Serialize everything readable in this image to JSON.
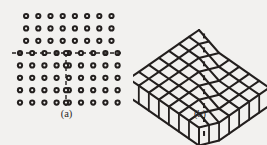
{
  "figure": {
    "background_color": "#f2f1ef",
    "ink_color": "#231f1e",
    "panels": [
      {
        "id": "a",
        "caption": "(a)",
        "type": "2d-atomic-lattice-edge-dislocation",
        "description": "Two-dimensional array of atoms (small open circles) containing an edge dislocation; horizontal dashed slip plane and vertical dashed extra half-plane trace.",
        "upper_rows": 3,
        "upper_columns": 8,
        "slip_row_columns": 9,
        "lower_rows": 4,
        "lower_columns": 9,
        "atom_symbol": "open-circle",
        "atom_outer_radius_px": 3.1,
        "atom_inner_radius_px": 1.1,
        "column_spacing_px": 12.2,
        "row_spacing_px": 12.4,
        "grid_left_px": 20,
        "grid_top_px": 16,
        "slip_plane_y_px": 53,
        "slip_plane_x_start_px": 12,
        "slip_plane_x_end_px": 122,
        "half_plane_x_px": 66,
        "half_plane_y_start_px": 53,
        "half_plane_y_end_px": 107,
        "dash_pattern": "4 3"
      },
      {
        "id": "b",
        "caption": "(b)",
        "type": "3d-isometric-lattice-block",
        "description": "Three-dimensional isometric ball-and-stick lattice block whose top surface is stepped by a dislocation line; vertical legs descend from the front and right edges.",
        "top_grid_rows": 7,
        "top_grid_cols": 7,
        "step_offset_px": 9,
        "leg_count_front": 8,
        "leg_count_right": 6,
        "leg_length_px": 18,
        "origin_x_px": 66,
        "origin_y_px": 30,
        "cell_u_px": 11.5,
        "cell_v_px": 11.5,
        "iso_dx_px": 7.6,
        "iso_dy_px": 4.3,
        "stroke_width_px": 2.1
      }
    ]
  }
}
